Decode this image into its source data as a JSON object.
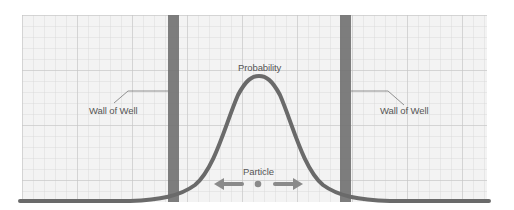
{
  "diagram": {
    "labels": {
      "probability": "Probability",
      "particle": "Particle",
      "left_wall": "Wall of Well",
      "right_wall": "Wall of Well"
    },
    "colors": {
      "background": "#ffffff",
      "grid_paper": "#f2f2f2",
      "grid_minor": "#d9d9d9",
      "grid_major": "#c4c4c4",
      "wall": "#6b6b6b",
      "curve": "#6e6e6e",
      "arrow": "#8a8a8a",
      "text": "#555555"
    }
  }
}
